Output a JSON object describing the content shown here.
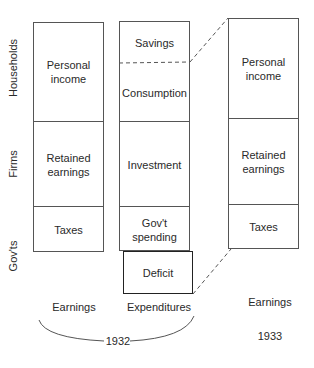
{
  "row_labels": {
    "households": "Households",
    "firms": "Firms",
    "govts": "Gov'ts"
  },
  "columns": {
    "earnings_1932": {
      "cells": [
        "Personal\nincome",
        "Retained\nearnings",
        "Taxes"
      ],
      "label": "Earnings"
    },
    "expenditures_1932": {
      "cells": [
        "Savings",
        "Consumption",
        "Investment",
        "Gov't\nspending"
      ],
      "deficit": "Deficit",
      "label": "Expenditures"
    },
    "earnings_1933": {
      "cells": [
        "Personal\nincome",
        "Retained\nearnings",
        "Taxes"
      ],
      "label": "Earnings",
      "year": "1933"
    }
  },
  "brace_year": "1932",
  "colors": {
    "line": "#555555",
    "deficit_border": "#222222",
    "text": "#2a2a2a"
  }
}
